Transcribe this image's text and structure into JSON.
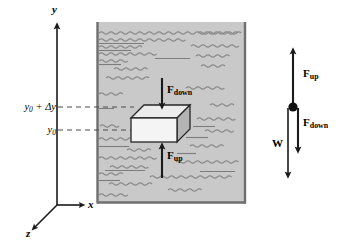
{
  "figure": {
    "colors": {
      "fluid_fill": "#c9c9c9",
      "fluid_wave": "#8c8c8c",
      "container_wall": "#7a7a7a",
      "block_front": "#f2f2f2",
      "block_top": "#e8e8e8",
      "block_side": "#b8b8b8",
      "block_outline": "#2b2b2b",
      "arrow": "#1a1a1a",
      "dashed": "#555555",
      "axis": "#1a1a1a"
    }
  },
  "axes": {
    "y_label": "y",
    "x_label": "x",
    "z_label": "z"
  },
  "ticks": [
    {
      "id": "upper",
      "label_main": "y",
      "label_sub": "0",
      "label_rest": " + Δy",
      "value": "y0 + Δy"
    },
    {
      "id": "lower",
      "label_main": "y",
      "label_sub": "0",
      "label_rest": "",
      "value": "y0"
    }
  ],
  "block_forces": {
    "down": {
      "name": "F",
      "sub": "down"
    },
    "up": {
      "name": "F",
      "sub": "up"
    }
  },
  "free_body": {
    "up": {
      "name": "F",
      "sub": "up"
    },
    "down": {
      "name": "F",
      "sub": "down"
    },
    "weight": {
      "name": "W",
      "sub": ""
    }
  }
}
